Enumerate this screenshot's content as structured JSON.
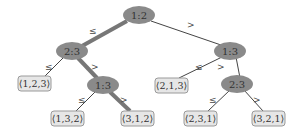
{
  "diagram": {
    "type": "decision-tree",
    "colors": {
      "node_fill": "#8a8a8a",
      "leaf_fill": "#e6e6e6",
      "leaf_stroke": "#9a9a9a",
      "edge": "#444444",
      "highlight_edge": "#777777"
    },
    "nodes": [
      {
        "id": "root",
        "label": "1:2"
      },
      {
        "id": "n23a",
        "label": "2:3"
      },
      {
        "id": "n13b",
        "label": "1:3"
      },
      {
        "id": "n13a",
        "label": "1:3"
      },
      {
        "id": "n23b",
        "label": "2:3"
      }
    ],
    "leaves": [
      {
        "id": "l123",
        "label": "⟨1,2,3⟩"
      },
      {
        "id": "l132",
        "label": "⟨1,3,2⟩"
      },
      {
        "id": "l312",
        "label": "⟨3,1,2⟩"
      },
      {
        "id": "l213",
        "label": "⟨2,1,3⟩"
      },
      {
        "id": "l231",
        "label": "⟨2,3,1⟩"
      },
      {
        "id": "l321",
        "label": "⟨3,2,1⟩"
      }
    ],
    "edge_labels": {
      "le": "≤",
      "gt": ">"
    },
    "highlighted_path": [
      "root",
      "n23a",
      "n13a",
      "l312"
    ]
  }
}
